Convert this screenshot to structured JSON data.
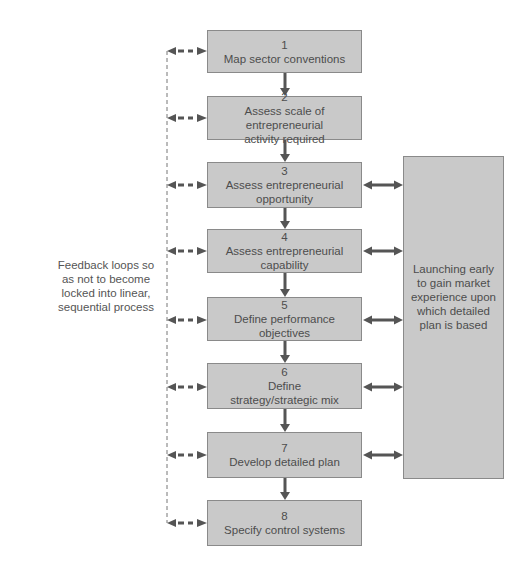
{
  "diagram": {
    "steps": [
      {
        "number": "1",
        "label": "Map sector conventions",
        "top": 30,
        "height": 43
      },
      {
        "number": "2",
        "label": "Assess scale of entrepreneurial\nactivity required",
        "top": 96,
        "height": 44
      },
      {
        "number": "3",
        "label": "Assess entrepreneurial\nopportunity",
        "top": 162,
        "height": 46
      },
      {
        "number": "4",
        "label": "Assess entrepreneurial\ncapability",
        "top": 229,
        "height": 44
      },
      {
        "number": "5",
        "label": "Define performance\nobjectives",
        "top": 297,
        "height": 44
      },
      {
        "number": "6",
        "label": "Define\nstrategy/strategic mix",
        "top": 363,
        "height": 46
      },
      {
        "number": "7",
        "label": "Develop detailed plan",
        "top": 432,
        "height": 46
      },
      {
        "number": "8",
        "label": "Specify control systems",
        "top": 500,
        "height": 46
      }
    ],
    "side_box": {
      "label": "Launching early\nto gain market\nexperience upon\nwhich detailed\nplan is based",
      "linked_steps": [
        "3",
        "4",
        "5",
        "6",
        "7"
      ]
    },
    "feedback_note": "Feedback loops so\nas not to become\nlocked into linear,\nsequential process",
    "colors": {
      "box_fill": "#c9c9c9",
      "box_border": "#8a8a8a",
      "arrow": "#555555",
      "text": "#4d4d4d"
    }
  }
}
